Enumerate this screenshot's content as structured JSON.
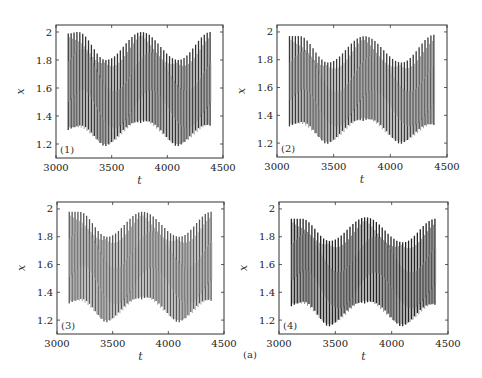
{
  "figure": {
    "caption_label": "(a)"
  },
  "panels": [
    {
      "label": "(1)",
      "xlabel": "t",
      "ylabel": "x",
      "box": [
        56,
        25,
        223,
        158
      ],
      "line_color": "#333333",
      "light_color": "#9a9a9a"
    },
    {
      "label": "(2)",
      "xlabel": "t",
      "ylabel": "x",
      "box": [
        277,
        25,
        447,
        157
      ],
      "line_color": "#3a3a3a",
      "light_color": "#a0a0a0"
    },
    {
      "label": "(3)",
      "xlabel": "t",
      "ylabel": "x",
      "box": [
        57,
        202,
        224,
        334
      ],
      "line_color": "#555555",
      "light_color": "#a8a8a8"
    },
    {
      "label": "(4)",
      "xlabel": "t",
      "ylabel": "x",
      "box": [
        279,
        202,
        448,
        334
      ],
      "line_color": "#222222",
      "light_color": "#8c8c8c"
    }
  ],
  "chart_data": [
    {
      "type": "line",
      "title": "(1)",
      "xlabel": "t",
      "ylabel": "x",
      "xlim": [
        3000,
        4500
      ],
      "ylim": [
        1.1,
        2.05
      ],
      "xticks": [
        3000,
        3500,
        4000,
        4500
      ],
      "yticks": [
        1.2,
        1.4,
        1.6,
        1.8,
        2
      ],
      "ytick_labels": [
        "1.2",
        "1.4",
        "1.6",
        "1.8",
        "2"
      ],
      "grid": false,
      "t_range": [
        3110,
        4390
      ],
      "fast_period": 26,
      "upper_envelope": {
        "t": [
          3110,
          3200,
          3450,
          3770,
          4100,
          4390
        ],
        "x": [
          1.99,
          2.0,
          1.8,
          2.0,
          1.8,
          2.0
        ]
      },
      "lower_envelope": {
        "t": [
          3110,
          3200,
          3450,
          3770,
          4100,
          4390
        ],
        "x": [
          1.3,
          1.3,
          1.18,
          1.35,
          1.18,
          1.32
        ]
      }
    },
    {
      "type": "line",
      "title": "(2)",
      "xlabel": "t",
      "ylabel": "x",
      "xlim": [
        3000,
        4500
      ],
      "ylim": [
        1.1,
        2.05
      ],
      "xticks": [
        3000,
        3500,
        4000,
        4500
      ],
      "yticks": [
        1.2,
        1.4,
        1.6,
        1.8,
        2
      ],
      "ytick_labels": [
        "1.2",
        "1.4",
        "1.6",
        "1.8",
        "2"
      ],
      "grid": false,
      "t_range": [
        3110,
        4390
      ],
      "fast_period": 26,
      "upper_envelope": {
        "t": [
          3110,
          3200,
          3450,
          3770,
          4100,
          4390
        ],
        "x": [
          1.97,
          1.97,
          1.78,
          1.97,
          1.78,
          1.98
        ]
      },
      "lower_envelope": {
        "t": [
          3110,
          3200,
          3450,
          3770,
          4100,
          4390
        ],
        "x": [
          1.32,
          1.32,
          1.19,
          1.36,
          1.19,
          1.32
        ]
      }
    },
    {
      "type": "line",
      "title": "(3)",
      "xlabel": "t",
      "ylabel": "x",
      "xlim": [
        3000,
        4500
      ],
      "ylim": [
        1.1,
        2.05
      ],
      "xticks": [
        3000,
        3500,
        4000,
        4500
      ],
      "yticks": [
        1.2,
        1.4,
        1.6,
        1.8,
        2
      ],
      "ytick_labels": [
        "1.2",
        "1.4",
        "1.6",
        "1.8",
        "2"
      ],
      "grid": false,
      "t_range": [
        3110,
        4390
      ],
      "fast_period": 26,
      "upper_envelope": {
        "t": [
          3110,
          3200,
          3450,
          3770,
          4100,
          4390
        ],
        "x": [
          1.98,
          1.98,
          1.8,
          1.98,
          1.8,
          1.98
        ]
      },
      "lower_envelope": {
        "t": [
          3110,
          3200,
          3450,
          3770,
          4100,
          4390
        ],
        "x": [
          1.32,
          1.32,
          1.18,
          1.35,
          1.18,
          1.33
        ]
      }
    },
    {
      "type": "line",
      "title": "(4)",
      "xlabel": "t",
      "ylabel": "x",
      "xlim": [
        3000,
        4500
      ],
      "ylim": [
        1.1,
        2.05
      ],
      "xticks": [
        3000,
        3500,
        4000,
        4500
      ],
      "yticks": [
        1.2,
        1.4,
        1.6,
        1.8,
        2
      ],
      "ytick_labels": [
        "1.2",
        "1.4",
        "1.6",
        "1.8",
        "2"
      ],
      "grid": false,
      "t_range": [
        3110,
        4390
      ],
      "fast_period": 26,
      "upper_envelope": {
        "t": [
          3110,
          3200,
          3450,
          3770,
          4100,
          4390
        ],
        "x": [
          1.93,
          1.93,
          1.77,
          1.94,
          1.76,
          1.93
        ]
      },
      "lower_envelope": {
        "t": [
          3110,
          3200,
          3450,
          3770,
          4100,
          4390
        ],
        "x": [
          1.3,
          1.3,
          1.15,
          1.32,
          1.15,
          1.3
        ]
      }
    }
  ]
}
